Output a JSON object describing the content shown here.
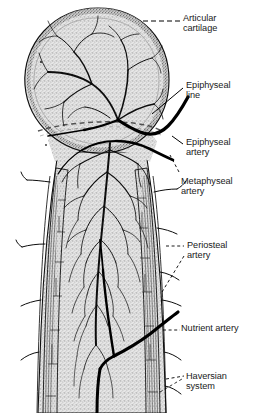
{
  "figure": {
    "style": "stippled line drawing, black ink on white",
    "colors": {
      "background": "#ffffff",
      "ink": "#000000",
      "bone_fill": "#d8d8d8",
      "cartilage_rim": "#9a9a9a",
      "cortex_fill": "#cfcfcf",
      "label_text": "#1a1a1a",
      "leader_line": "#000000"
    }
  },
  "labels": [
    {
      "id": "articular-cartilage",
      "text": "Articular\ncartilage",
      "x": 183,
      "y": 13,
      "leader": "dashed",
      "align": "left"
    },
    {
      "id": "epiphyseal-line",
      "text": "Epiphyseal\nline",
      "x": 186,
      "y": 80,
      "leader": "solid",
      "align": "left"
    },
    {
      "id": "epiphyseal-artery",
      "text": "Epiphyseal\nartery",
      "x": 186,
      "y": 137,
      "leader": "solid",
      "align": "left"
    },
    {
      "id": "metaphyseal-artery",
      "text": "Metaphyseal\nartery",
      "x": 181,
      "y": 176,
      "leader": "dashed",
      "align": "left"
    },
    {
      "id": "periosteal-artery",
      "text": "Periosteal\nartery",
      "x": 187,
      "y": 240,
      "leader": "dashed",
      "align": "left"
    },
    {
      "id": "nutrient-artery",
      "text": "Nutrient artery",
      "x": 181,
      "y": 323,
      "leader": "dashed",
      "align": "left"
    },
    {
      "id": "haversian-system",
      "text": "Haversian\nsystem",
      "x": 186,
      "y": 371,
      "leader": "dashed",
      "align": "left"
    }
  ],
  "structures": [
    {
      "id": "epiphysis",
      "name": "epiphysis (bone head)",
      "shape": "round"
    },
    {
      "id": "articular-cartilage-rim",
      "name": "articular cartilage rim",
      "shape": "arc-band"
    },
    {
      "id": "epiphyseal-line-band",
      "name": "epiphyseal line",
      "shape": "dashed-band"
    },
    {
      "id": "metaphysis",
      "name": "metaphysis (flared neck)",
      "shape": "taper"
    },
    {
      "id": "diaphysis",
      "name": "diaphysis (shaft)",
      "shape": "column"
    },
    {
      "id": "cortex-left",
      "name": "left cortical wall",
      "shape": "striated-band"
    },
    {
      "id": "cortex-right",
      "name": "right cortical wall",
      "shape": "striated-band"
    },
    {
      "id": "medullary-cavity",
      "name": "medullary cavity",
      "shape": "column"
    },
    {
      "id": "epiphyseal-artery-vessel",
      "name": "epiphyseal artery",
      "shape": "thick-curve"
    },
    {
      "id": "metaphyseal-artery-vessel",
      "name": "metaphyseal artery",
      "shape": "thick-curve"
    },
    {
      "id": "nutrient-artery-vessel",
      "name": "nutrient artery",
      "shape": "thick-curve"
    },
    {
      "id": "periosteal-artery-branches",
      "name": "periosteal artery branches",
      "shape": "small-branches"
    },
    {
      "id": "vascular-tree",
      "name": "intraosseous vascular tree",
      "shape": "branching-network"
    }
  ]
}
